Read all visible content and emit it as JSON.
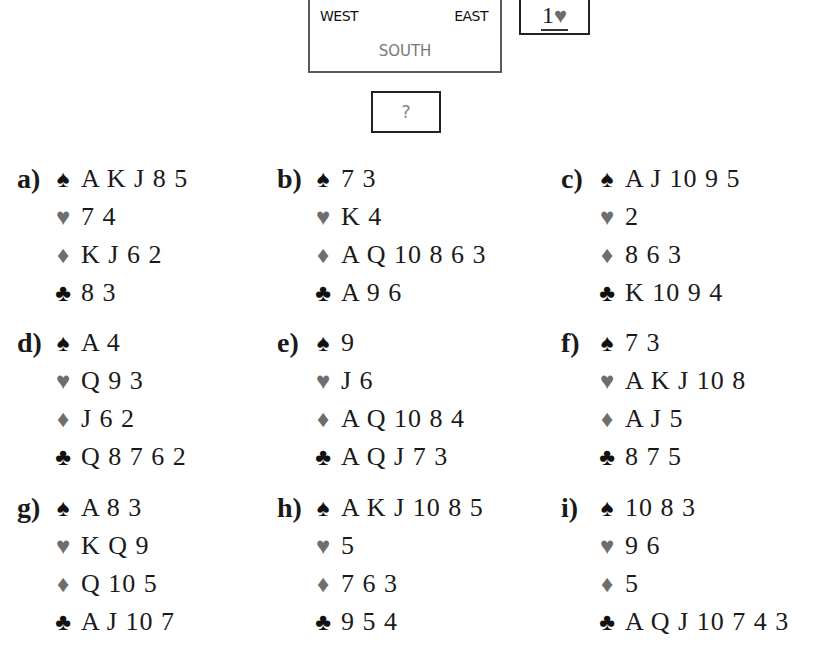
{
  "diagram": {
    "west": "WEST",
    "east": "EAST",
    "south": "SOUTH",
    "bid_level": "1",
    "bid_suit": "♥",
    "question": "?"
  },
  "colors": {
    "black_suit": "#111111",
    "red_suit": "#6e6e6e",
    "text": "#1a1a1a",
    "south_label": "#777777"
  },
  "suit_glyphs": {
    "spades": "♠",
    "hearts": "♥",
    "diamonds": "♦",
    "clubs": "♣"
  },
  "hands": [
    {
      "label": "a)",
      "spades": "A K J 8 5",
      "hearts": "7 4",
      "diamonds": "K J 6 2",
      "clubs": "8 3"
    },
    {
      "label": "b)",
      "spades": "7 3",
      "hearts": "K 4",
      "diamonds": "A Q 10 8 6 3",
      "clubs": "A 9 6"
    },
    {
      "label": "c)",
      "spades": "A J 10 9 5",
      "hearts": "2",
      "diamonds": "8 6 3",
      "clubs": "K 10 9 4"
    },
    {
      "label": "d)",
      "spades": "A 4",
      "hearts": "Q 9 3",
      "diamonds": "J 6 2",
      "clubs": "Q 8 7 6 2"
    },
    {
      "label": "e)",
      "spades": "9",
      "hearts": "J 6",
      "diamonds": "A Q 10 8 4",
      "clubs": "A Q J 7 3"
    },
    {
      "label": "f)",
      "spades": "7 3",
      "hearts": "A K J 10 8",
      "diamonds": "A J 5",
      "clubs": "8 7 5"
    },
    {
      "label": "g)",
      "spades": "A 8 3",
      "hearts": "K Q 9",
      "diamonds": "Q 10 5",
      "clubs": "A J 10 7"
    },
    {
      "label": "h)",
      "spades": "A K J 10 8 5",
      "hearts": "5",
      "diamonds": "7 6 3",
      "clubs": "9 5 4"
    },
    {
      "label": "i)",
      "spades": "10 8 3",
      "hearts": "9 6",
      "diamonds": "5",
      "clubs": "A Q J 10 7 4 3"
    }
  ]
}
